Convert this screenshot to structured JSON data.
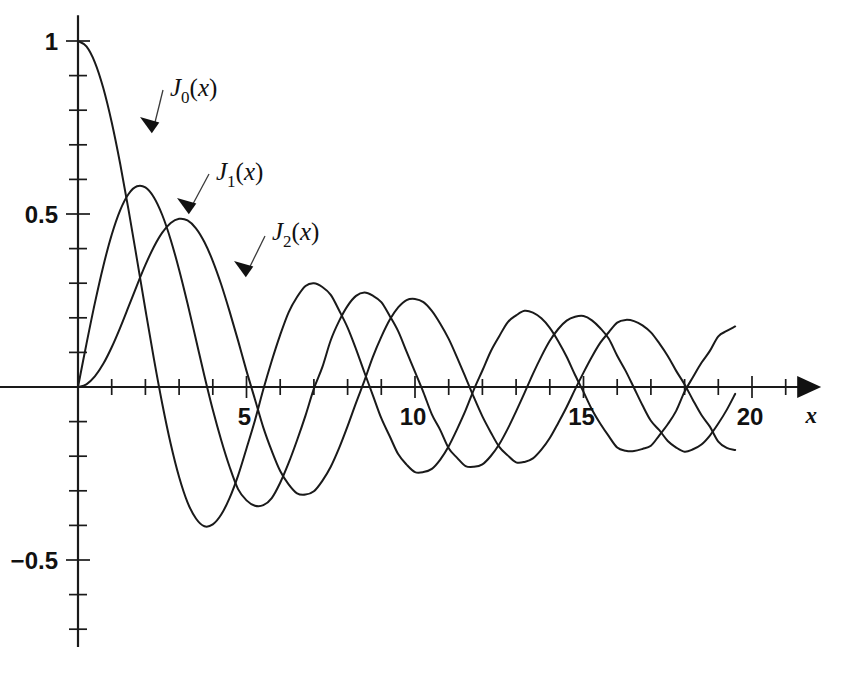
{
  "chart_data": {
    "type": "line",
    "title": "",
    "subtitle": "",
    "xlabel": "x",
    "ylabel": "",
    "xlim": [
      -0.6,
      23.2
    ],
    "ylim": [
      -0.78,
      1.06
    ],
    "grid": false,
    "legend_position": "inline-annotations",
    "x_ticks_major": [
      5,
      10,
      15,
      20
    ],
    "x_tick_labels": [
      "5",
      "10",
      "15",
      "20"
    ],
    "x_ticks_minor": [
      1,
      2,
      3,
      4,
      6,
      7,
      8,
      9,
      11,
      12,
      13,
      14,
      16,
      17,
      18,
      19,
      21
    ],
    "y_ticks_major": [
      1,
      0.5,
      -0.5
    ],
    "y_tick_labels": [
      "1",
      "0.5",
      "−0.5"
    ],
    "y_ticks_minor": [
      0.9,
      0.8,
      0.7,
      0.6,
      0.4,
      0.3,
      0.2,
      0.1,
      -0.1,
      -0.2,
      -0.3,
      -0.4,
      -0.6,
      -0.7
    ],
    "axis_origin": [
      0,
      0
    ],
    "series": [
      {
        "name": "J_0(x)",
        "label_text": "J",
        "label_sub": "0",
        "label_arg": "(x)",
        "order": 0,
        "color": "#1a1a1a",
        "x": [
          0,
          0.25,
          0.5,
          0.75,
          1,
          1.25,
          1.5,
          1.75,
          2,
          2.25,
          2.5,
          2.75,
          3,
          3.25,
          3.5,
          3.75,
          4,
          4.25,
          4.5,
          4.75,
          5,
          5.25,
          5.5,
          5.75,
          6,
          6.25,
          6.5,
          6.75,
          7,
          7.25,
          7.5,
          7.75,
          8,
          8.25,
          8.5,
          8.75,
          9,
          9.25,
          9.5,
          9.75,
          10,
          10.25,
          10.5,
          10.75,
          11,
          11.25,
          11.5,
          11.75,
          12,
          12.25,
          12.5,
          12.75,
          13,
          13.25,
          13.5,
          13.75,
          14,
          14.25,
          14.5,
          14.75,
          15,
          15.25,
          15.5,
          15.75,
          16,
          16.25,
          16.5,
          16.75,
          17,
          17.25,
          17.5,
          17.75,
          18,
          18.25,
          18.5,
          18.75,
          19,
          19.25,
          19.5
        ],
        "y": [
          1,
          0.9844,
          0.9385,
          0.8642,
          0.7652,
          0.6459,
          0.5118,
          0.369,
          0.2239,
          0.0827,
          -0.0484,
          -0.1641,
          -0.2601,
          -0.3332,
          -0.3801,
          -0.4026,
          -0.3971,
          -0.3686,
          -0.3205,
          -0.2561,
          -0.1776,
          -0.0968,
          -0.0068,
          0.0758,
          0.1506,
          0.2159,
          0.2601,
          0.2921,
          0.3001,
          0.2891,
          0.2663,
          0.2211,
          0.1717,
          0.1096,
          0.0419,
          -0.0241,
          -0.0903,
          -0.1424,
          -0.1939,
          -0.2243,
          -0.2459,
          -0.2459,
          -0.2366,
          -0.2097,
          -0.1712,
          -0.1217,
          -0.0677,
          -0.0068,
          0.0477,
          0.1035,
          0.1469,
          0.1871,
          0.2069,
          0.2203,
          0.215,
          0.1985,
          0.1711,
          0.1325,
          0.0875,
          0.0347,
          -0.0142,
          -0.065,
          -0.1063,
          -0.1422,
          -0.1749,
          -0.184,
          -0.185,
          -0.179,
          -0.1699,
          -0.1396,
          -0.1076,
          -0.0689,
          -0.0134,
          0.0289,
          0.0699,
          0.1044,
          0.1466,
          0.1619,
          0.1749
        ]
      },
      {
        "name": "J_1(x)",
        "label_text": "J",
        "label_sub": "1",
        "label_arg": "(x)",
        "order": 1,
        "color": "#1a1a1a",
        "x": [
          0,
          0.25,
          0.5,
          0.75,
          1,
          1.25,
          1.5,
          1.75,
          2,
          2.25,
          2.5,
          2.75,
          3,
          3.25,
          3.5,
          3.75,
          4,
          4.25,
          4.5,
          4.75,
          5,
          5.25,
          5.5,
          5.75,
          6,
          6.25,
          6.5,
          6.75,
          7,
          7.25,
          7.5,
          7.75,
          8,
          8.25,
          8.5,
          8.75,
          9,
          9.25,
          9.5,
          9.75,
          10,
          10.25,
          10.5,
          10.75,
          11,
          11.25,
          11.5,
          11.75,
          12,
          12.25,
          12.5,
          12.75,
          13,
          13.25,
          13.5,
          13.75,
          14,
          14.25,
          14.5,
          14.75,
          15,
          15.25,
          15.5,
          15.75,
          16,
          16.25,
          16.5,
          16.75,
          17,
          17.25,
          17.5,
          17.75,
          18,
          18.25,
          18.5,
          18.75,
          19,
          19.25,
          19.5
        ],
        "y": [
          0,
          0.124,
          0.2423,
          0.3492,
          0.4401,
          0.5106,
          0.5579,
          0.5802,
          0.5767,
          0.5484,
          0.4971,
          0.4258,
          0.3391,
          0.2414,
          0.1374,
          0.0325,
          -0.066,
          -0.1538,
          -0.2311,
          -0.2951,
          -0.3276,
          -0.343,
          -0.3414,
          -0.3209,
          -0.2767,
          -0.2196,
          -0.1538,
          -0.0826,
          -0.0047,
          0.0574,
          0.1352,
          0.1911,
          0.2346,
          0.2634,
          0.2731,
          0.2639,
          0.2453,
          0.2055,
          0.1613,
          0.102,
          0.0435,
          -0.0153,
          -0.0789,
          -0.1245,
          -0.1768,
          -0.2047,
          -0.2284,
          -0.2306,
          -0.2234,
          -0.1994,
          -0.1655,
          -0.121,
          -0.0703,
          -0.017,
          0.038,
          0.0885,
          0.1334,
          0.1676,
          0.1918,
          0.2029,
          0.2051,
          0.1927,
          0.1699,
          0.1394,
          0.0904,
          0.0466,
          -0.0029,
          -0.0528,
          -0.0977,
          -0.1248,
          -0.156,
          -0.175,
          -0.187,
          -0.18,
          -0.1662,
          -0.1403,
          -0.1057,
          -0.0661,
          -0.02
        ]
      },
      {
        "name": "J_2(x)",
        "label_text": "J",
        "label_sub": "2",
        "label_arg": "(x)",
        "order": 2,
        "color": "#1a1a1a",
        "x": [
          0,
          0.25,
          0.5,
          0.75,
          1,
          1.25,
          1.5,
          1.75,
          2,
          2.25,
          2.5,
          2.75,
          3,
          3.25,
          3.5,
          3.75,
          4,
          4.25,
          4.5,
          4.75,
          5,
          5.25,
          5.5,
          5.75,
          6,
          6.25,
          6.5,
          6.75,
          7,
          7.25,
          7.5,
          7.75,
          8,
          8.25,
          8.5,
          8.75,
          9,
          9.25,
          9.5,
          9.75,
          10,
          10.25,
          10.5,
          10.75,
          11,
          11.25,
          11.5,
          11.75,
          12,
          12.25,
          12.5,
          12.75,
          13,
          13.25,
          13.5,
          13.75,
          14,
          14.25,
          14.5,
          14.75,
          15,
          15.25,
          15.5,
          15.75,
          16,
          16.25,
          16.5,
          16.75,
          17,
          17.25,
          17.5,
          17.75,
          18,
          18.25,
          18.5,
          18.75,
          19,
          19.25,
          19.5
        ],
        "y": [
          0,
          0.0078,
          0.0306,
          0.067,
          0.1149,
          0.1711,
          0.2321,
          0.294,
          0.3528,
          0.4048,
          0.4461,
          0.4739,
          0.4861,
          0.4813,
          0.4586,
          0.4189,
          0.3641,
          0.2962,
          0.2178,
          0.134,
          0.0466,
          -0.0352,
          -0.1173,
          -0.1849,
          -0.2429,
          -0.2815,
          -0.3074,
          -0.311,
          -0.3014,
          -0.2712,
          -0.2303,
          -0.1759,
          -0.113,
          -0.0458,
          0.0184,
          0.0871,
          0.1448,
          0.1941,
          0.23,
          0.2512,
          0.2546,
          0.2454,
          0.2199,
          0.1828,
          0.139,
          0.0849,
          0.0279,
          -0.0304,
          -0.0849,
          -0.1312,
          -0.173,
          -0.1976,
          -0.2177,
          -0.2165,
          -0.2063,
          -0.1812,
          -0.1475,
          -0.1039,
          -0.0576,
          -0.0069,
          0.0416,
          0.0874,
          0.1281,
          0.1582,
          0.1862,
          0.194,
          0.1905,
          0.1782,
          0.1578,
          0.126,
          0.0897,
          0.0466,
          0.0074,
          -0.0381,
          -0.081,
          -0.1146,
          -0.1578,
          -0.1761,
          -0.182
        ]
      }
    ],
    "annotations": [
      {
        "series": "J_0(x)",
        "label": "J0(x)",
        "text_x": 170,
        "text_y": 96,
        "leader_from_x": 163,
        "leader_from_y": 90,
        "point_x": 140,
        "point_y": 117,
        "arrow_angle": 215
      },
      {
        "series": "J_1(x)",
        "label": "J1(x)",
        "text_x": 216,
        "text_y": 180,
        "leader_from_x": 209,
        "leader_from_y": 174,
        "point_x": 177,
        "point_y": 198,
        "arrow_angle": 215
      },
      {
        "series": "J_2(x)",
        "label": "J2(x)",
        "text_x": 272,
        "text_y": 240,
        "leader_from_x": 265,
        "leader_from_y": 236,
        "point_x": 234,
        "point_y": 261,
        "arrow_angle": 215
      }
    ]
  },
  "figure": {
    "background_color": "#ffffff",
    "line_color": "#1a1a1a",
    "axis_x_label": "x",
    "y_labels": [
      "1",
      "0.5",
      "−0.5"
    ],
    "x_labels": [
      "5",
      "10",
      "15",
      "20"
    ]
  }
}
